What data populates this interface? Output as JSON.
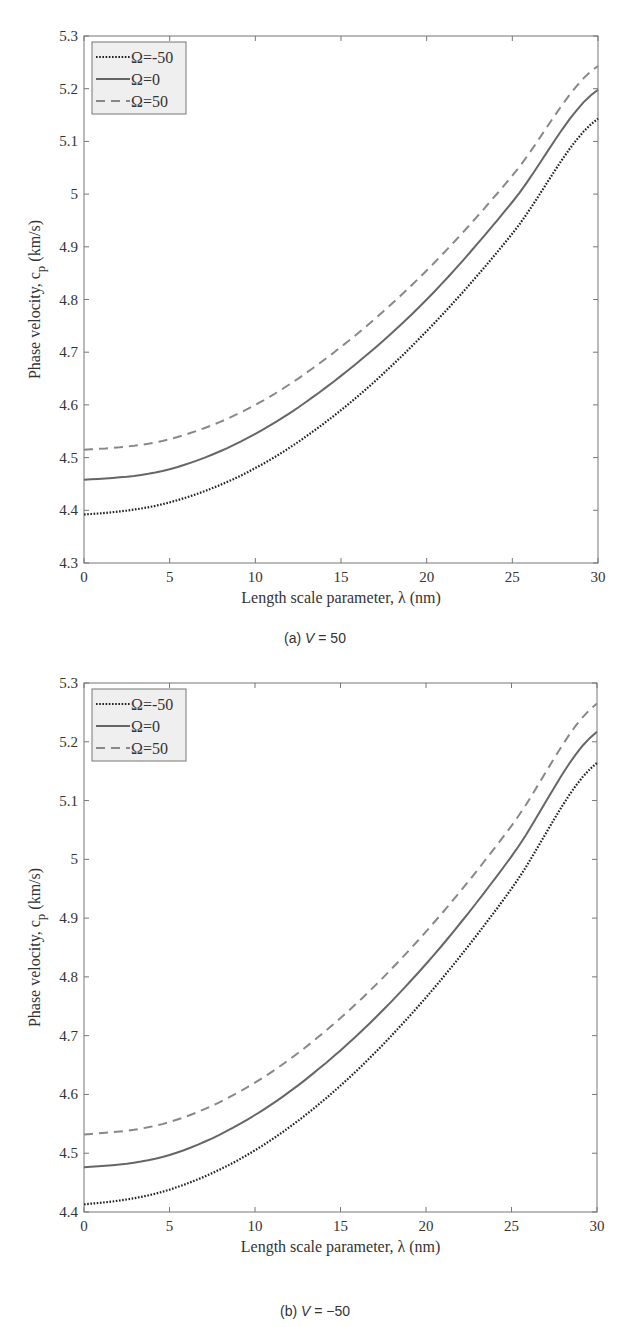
{
  "chart_data": [
    {
      "type": "line",
      "title": "",
      "caption": {
        "prefix": "(a) ",
        "var": "V",
        "suffix": " = 50"
      },
      "xlabel": "Length scale parameter, λ (nm)",
      "ylabel": "Phase velocity, c_p (km/s)",
      "xlim": [
        0,
        30
      ],
      "ylim": [
        4.3,
        5.3
      ],
      "xticks": [
        0,
        5,
        10,
        15,
        20,
        25,
        30
      ],
      "yticks": [
        4.3,
        4.4,
        4.5,
        4.6,
        4.7,
        4.8,
        4.9,
        5,
        5.1,
        5.2,
        5.3
      ],
      "ytick_labels": [
        "4.3",
        "4.4",
        "4.5",
        "4.6",
        "4.7",
        "4.8",
        "4.9",
        "5",
        "5.1",
        "5.2",
        "5.3"
      ],
      "grid": false,
      "legend_position": "upper-left",
      "x": [
        0,
        5,
        10,
        15,
        20,
        25,
        30
      ],
      "series": [
        {
          "name": "Ω=-50",
          "style": "dotted",
          "values": [
            4.392,
            4.415,
            4.48,
            4.59,
            4.74,
            4.925,
            5.143
          ]
        },
        {
          "name": "Ω=0",
          "style": "solid",
          "values": [
            4.458,
            4.478,
            4.545,
            4.655,
            4.8,
            4.985,
            5.198
          ]
        },
        {
          "name": "Ω=50",
          "style": "dashed",
          "values": [
            4.515,
            4.535,
            4.6,
            4.71,
            4.855,
            5.035,
            5.243
          ]
        }
      ]
    },
    {
      "type": "line",
      "title": "",
      "caption": {
        "prefix": "(b) ",
        "var": "V",
        "suffix": " = −50"
      },
      "xlabel": "Length scale parameter, λ (nm)",
      "ylabel": "Phase velocity, c_p (km/s)",
      "xlim": [
        0,
        30
      ],
      "ylim": [
        4.4,
        5.3
      ],
      "xticks": [
        0,
        5,
        10,
        15,
        20,
        25,
        30
      ],
      "yticks": [
        4.4,
        4.5,
        4.6,
        4.7,
        4.8,
        4.9,
        5,
        5.1,
        5.2,
        5.3
      ],
      "ytick_labels": [
        "4.4",
        "4.5",
        "4.6",
        "4.7",
        "4.8",
        "4.9",
        "5",
        "5.1",
        "5.2",
        "5.3"
      ],
      "grid": false,
      "legend_position": "upper-left",
      "x": [
        0,
        5,
        10,
        15,
        20,
        25,
        30
      ],
      "series": [
        {
          "name": "Ω=-50",
          "style": "dotted",
          "values": [
            4.413,
            4.438,
            4.505,
            4.615,
            4.765,
            4.95,
            5.164
          ]
        },
        {
          "name": "Ω=0",
          "style": "solid",
          "values": [
            4.476,
            4.497,
            4.565,
            4.675,
            4.822,
            5.005,
            5.217
          ]
        },
        {
          "name": "Ω=50",
          "style": "dashed",
          "values": [
            4.532,
            4.553,
            4.62,
            4.73,
            4.877,
            5.057,
            5.265
          ]
        }
      ]
    }
  ],
  "colors": {
    "axis": "#777777",
    "text": "#333333",
    "dotted": "#222222",
    "solid": "#666666",
    "dashed": "#888888",
    "legend_bg": "#efefef",
    "legend_border": "#777777"
  }
}
